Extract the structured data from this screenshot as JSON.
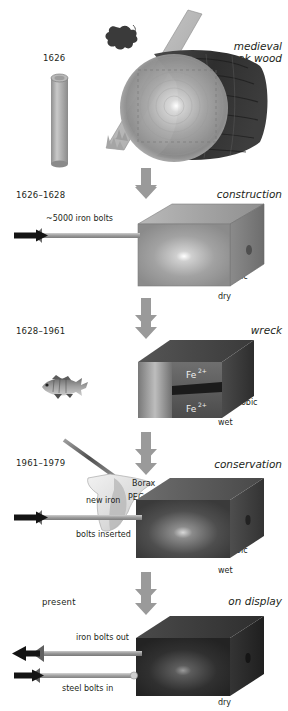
{
  "diagram": {
    "stages": [
      {
        "id": "felling",
        "year": "1626",
        "title": "medieval\noak wood",
        "title_line1": "medieval",
        "title_line2": "oak wood",
        "conditions": "",
        "icons": [
          "oak-leaf-icon",
          "saw-icon",
          "log-icon"
        ],
        "bolt_labels": []
      },
      {
        "id": "construction",
        "year": "1626–1628",
        "title": "construction",
        "conditions": "aerobic\ndry",
        "conditions_line1": "aerobic",
        "conditions_line2": "dry",
        "bolt_labels": [
          "~5000 iron bolts"
        ],
        "bolt_label_1": "~5000 iron bolts"
      },
      {
        "id": "wreck",
        "year": "1628–1961",
        "title": "wreck",
        "conditions": "anaerobic\nwet",
        "conditions_line1": "anaerobic",
        "conditions_line2": "wet",
        "species_labels": [
          "Fe",
          "Fe"
        ],
        "ion_label": "Fe",
        "ion_charge": "2+",
        "icons": [
          "fish-icon"
        ]
      },
      {
        "id": "conservation",
        "year": "1961–1979",
        "title": "conservation",
        "conditions": "aerobic\nwet",
        "conditions_line1": "aerobic",
        "conditions_line2": "wet",
        "treatment_1": "Borax",
        "treatment_2": "PEG",
        "bolt_label_line1": "new iron",
        "bolt_label_line2": "bolts inserted",
        "icons": [
          "spray-nozzle-icon"
        ]
      },
      {
        "id": "on-display",
        "year": "present",
        "title": "on display",
        "conditions": "aerobic\ndry",
        "conditions_line1": "aerobic",
        "conditions_line2": "dry",
        "bolt_label_1": "iron bolts out",
        "bolt_label_2": "steel bolts in"
      }
    ],
    "colors": {
      "arrow_gray": "#9a9a9a",
      "text": "#231f20",
      "bolt_gray": "#a8a8a8",
      "block_dark": "#2b2b2b",
      "block_mid": "#6e6e6e",
      "saw_blade": "#b8b8b8"
    }
  }
}
